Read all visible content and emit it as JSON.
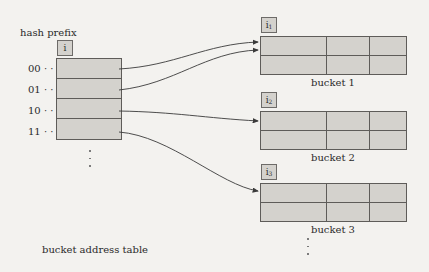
{
  "diagram": {
    "title_label": "hash prefix",
    "global_depth_label": "i",
    "table_caption": "bucket address table",
    "table_rows": [
      {
        "prefix": "00 · ·",
        "points_to": "bucket 1"
      },
      {
        "prefix": "01 · ·",
        "points_to": "bucket 1"
      },
      {
        "prefix": "10 · ·",
        "points_to": "bucket 2"
      },
      {
        "prefix": "11 · ·",
        "points_to": "bucket 3"
      }
    ],
    "buckets": [
      {
        "name": "bucket 1",
        "local_depth": "i",
        "local_depth_sub": "1"
      },
      {
        "name": "bucket 2",
        "local_depth": "i",
        "local_depth_sub": "2"
      },
      {
        "name": "bucket 3",
        "local_depth": "i",
        "local_depth_sub": "3"
      }
    ],
    "continuation": "⋮"
  },
  "colors": {
    "background": "#f3f2ef",
    "box_fill": "#d4d2cd",
    "stroke": "#5e5c59"
  }
}
